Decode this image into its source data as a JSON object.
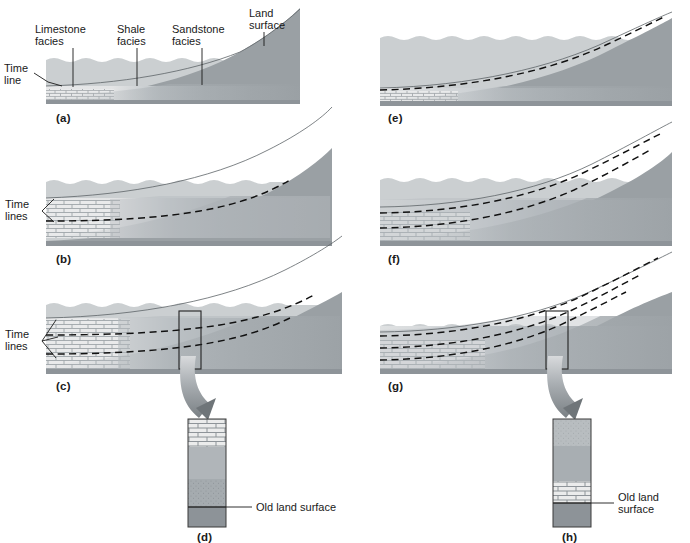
{
  "figure": {
    "width": 690,
    "height": 543,
    "background": "#ffffff"
  },
  "colors": {
    "sea_water": "#c9cdcf",
    "sea_water_light": "#d2d6d8",
    "basement_rock": "#9aa0a4",
    "old_land_surface": "#8d9398",
    "limestone": "#e8e9ea",
    "limestone_line": "#8a9095",
    "shale": "#b0b5b9",
    "sandstone": "#a2a8ac",
    "sandstone_dark": "#979 da",
    "dashed_timeline": "#111111",
    "text": "#1a1a1a",
    "arrow_ribbon": "#7d8387",
    "callout_box": "#222222"
  },
  "labels": {
    "limestone_facies": "Limestone\nfacies",
    "limestone_facies_line1": "Limestone",
    "limestone_facies_line2": "facies",
    "shale_facies_line1": "Shale",
    "shale_facies_line2": "facies",
    "sandstone_facies_line1": "Sandstone",
    "sandstone_facies_line2": "facies",
    "land_surface_line1": "Land",
    "land_surface_line2": "surface",
    "time_line_line1": "Time",
    "time_line_line2": "line",
    "time_lines_line1": "Time",
    "time_lines_line2": "lines",
    "old_land_surface_one_line": "Old land surface",
    "old_land_surface_line1": "Old land",
    "old_land_surface_line2": "surface"
  },
  "panels": [
    {
      "id": "a",
      "letter": "(a)",
      "column": "left",
      "row": 1,
      "sequence": "transgression",
      "stage": 1,
      "description": "Initial thin wedge of sediment; limestone facies nearshore at left, shale and sandstone grading toward the rising land surface at right. One time line marks the base of the deposit.",
      "timelines": 0,
      "timeline_label": "Time line",
      "facies_present": [
        "limestone",
        "shale",
        "sandstone"
      ],
      "callout": false
    },
    {
      "id": "b",
      "letter": "(b)",
      "column": "left",
      "row": 2,
      "sequence": "transgression",
      "stage": 2,
      "description": "Sea advances landward; the sedimentary wedge thickens and facies belts migrate to the right. One dashed time line crosses the facies boundaries.",
      "timelines": 1,
      "timeline_label": "Time lines",
      "facies_present": [
        "limestone",
        "shale",
        "sandstone"
      ],
      "callout": false
    },
    {
      "id": "c",
      "letter": "(c)",
      "column": "left",
      "row": 3,
      "sequence": "transgression",
      "stage": 3,
      "description": "Continued transgression; a thick limestone body overlies shale and sandstone. Two dashed time lines cut obliquely across the facies. A vertical callout column is sampled.",
      "timelines": 2,
      "timeline_label": "Time lines",
      "facies_present": [
        "limestone",
        "shale",
        "sandstone"
      ],
      "callout": true,
      "callout_target": "d"
    },
    {
      "id": "d",
      "letter": "(d)",
      "column": "left",
      "row": 4,
      "type": "stratigraphic-column",
      "description": "Vertical stratigraphic column produced by transgression: limestone on top, grading down through shale to sandstone, resting on the old land surface.",
      "annotation": "Old land surface",
      "annotation_lines": [
        "Old land surface"
      ],
      "column_layers": [
        {
          "name": "limestone",
          "pattern": "brick",
          "fraction": 0.26
        },
        {
          "name": "shale",
          "pattern": "solid",
          "fraction": 0.3
        },
        {
          "name": "sandstone",
          "pattern": "stipple",
          "fraction": 0.26
        },
        {
          "name": "old-land-surface",
          "pattern": "solid-dark",
          "fraction": 0.18
        }
      ]
    },
    {
      "id": "e",
      "letter": "(e)",
      "column": "right",
      "row": 1,
      "sequence": "regression",
      "stage": 1,
      "description": "Sea begins to withdraw; a thin sediment sheet lies at the base with limestone at far left and sandstone advancing seaward over it.",
      "timelines": 1,
      "facies_present": [
        "limestone",
        "shale",
        "sandstone"
      ],
      "callout": false
    },
    {
      "id": "f",
      "letter": "(f)",
      "column": "right",
      "row": 2,
      "sequence": "regression",
      "stage": 2,
      "description": "Regression continues; coarse sandstone facies prograde seaward over shale and limestone. Dashed time lines climb to the right.",
      "timelines": 2,
      "facies_present": [
        "limestone",
        "shale",
        "sandstone"
      ],
      "callout": false
    },
    {
      "id": "g",
      "letter": "(g)",
      "column": "right",
      "row": 3,
      "sequence": "regression",
      "stage": 3,
      "description": "Fully developed regressive wedge; sandstone caps the sequence above shale and limestone. Three dashed time lines; a vertical callout column is sampled.",
      "timelines": 3,
      "facies_present": [
        "limestone",
        "shale",
        "sandstone"
      ],
      "callout": true,
      "callout_target": "h"
    },
    {
      "id": "h",
      "letter": "(h)",
      "column": "right",
      "row": 4,
      "type": "stratigraphic-column",
      "description": "Vertical stratigraphic column produced by regression: sandstone on top, grading down through shale to limestone, resting on the old land surface.",
      "annotation": "Old land surface",
      "annotation_lines": [
        "Old land",
        "surface"
      ],
      "column_layers": [
        {
          "name": "sandstone",
          "pattern": "stipple",
          "fraction": 0.25
        },
        {
          "name": "shale",
          "pattern": "solid",
          "fraction": 0.32
        },
        {
          "name": "limestone",
          "pattern": "brick",
          "fraction": 0.2
        },
        {
          "name": "old-land-surface",
          "pattern": "solid-dark",
          "fraction": 0.23
        }
      ]
    }
  ],
  "callout_labels": {
    "d_letter": "(d)",
    "h_letter": "(h)"
  }
}
